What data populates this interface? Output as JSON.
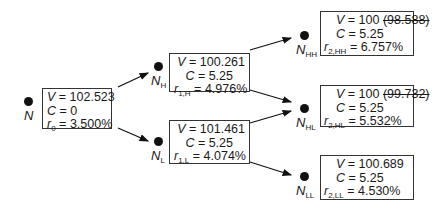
{
  "nodes": {
    "N": {
      "label": "N",
      "sub": "",
      "V": "102.523",
      "C": "0",
      "r_sym": "r",
      "r_sub": "0",
      "r": "3.500%",
      "V_old": ""
    },
    "NH": {
      "label": "N",
      "sub": "H",
      "V": "100.261",
      "C": "5.25",
      "r_sym": "r",
      "r_sub": "1,H",
      "r": "4.976%",
      "V_old": ""
    },
    "NL": {
      "label": "N",
      "sub": "L",
      "V": "101.461",
      "C": "5.25",
      "r_sym": "r",
      "r_sub": "1,L",
      "r": "4.074%",
      "V_old": ""
    },
    "NHH": {
      "label": "N",
      "sub": "HH",
      "V": "100",
      "C": "5.25",
      "r_sym": "r",
      "r_sub": "2,HH",
      "r": "6.757%",
      "V_old": "(98.588)"
    },
    "NHL": {
      "label": "N",
      "sub": "HL",
      "V": "100",
      "C": "5.25",
      "r_sym": "r",
      "r_sub": "2,HL",
      "r": "5.532%",
      "V_old": "(99.732)"
    },
    "NLL": {
      "label": "N",
      "sub": "LL",
      "V": "100.689",
      "C": "5.25",
      "r_sym": "r",
      "r_sub": "2,LL",
      "r": "4.530%",
      "V_old": ""
    }
  },
  "symbols": {
    "V": "V",
    "C": "C",
    "eq": " = "
  },
  "edges": [
    [
      "N",
      "NH"
    ],
    [
      "N",
      "NL"
    ],
    [
      "NH",
      "NHH"
    ],
    [
      "NH",
      "NHL"
    ],
    [
      "NL",
      "NHL"
    ],
    [
      "NL",
      "NLL"
    ]
  ]
}
